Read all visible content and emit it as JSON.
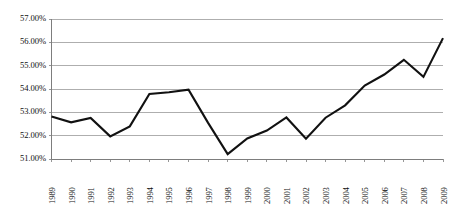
{
  "chart_data": {
    "type": "line",
    "title": "",
    "subtitle": "",
    "xlabel": "",
    "ylabel": "",
    "grid": "horizontal",
    "legend": "none",
    "ylim": [
      51.0,
      57.0
    ],
    "ytick_values": [
      51.0,
      52.0,
      53.0,
      54.0,
      55.0,
      56.0,
      57.0
    ],
    "ytick_labels": [
      "51.00%",
      "52.00%",
      "53.00%",
      "54.00%",
      "55.00%",
      "56.00%",
      "57.00%"
    ],
    "categories": [
      "1989",
      "1990",
      "1991",
      "1992",
      "1993",
      "1994",
      "1995",
      "1996",
      "1997",
      "1998",
      "1999",
      "2000",
      "2001",
      "2002",
      "2003",
      "2004",
      "2005",
      "2006",
      "2007",
      "2008",
      "2009"
    ],
    "series": [
      {
        "name": "",
        "color": "#111111",
        "values": [
          52.82,
          52.57,
          52.76,
          51.97,
          52.4,
          53.79,
          53.86,
          53.97,
          52.55,
          51.21,
          51.88,
          52.22,
          52.78,
          51.87,
          52.77,
          53.3,
          54.15,
          54.62,
          55.25,
          54.52,
          56.18
        ]
      }
    ]
  },
  "axis": {
    "y_gridline_color": "#9a9a9a",
    "axis_color": "#7d7d7d",
    "line_color": "#111111"
  }
}
